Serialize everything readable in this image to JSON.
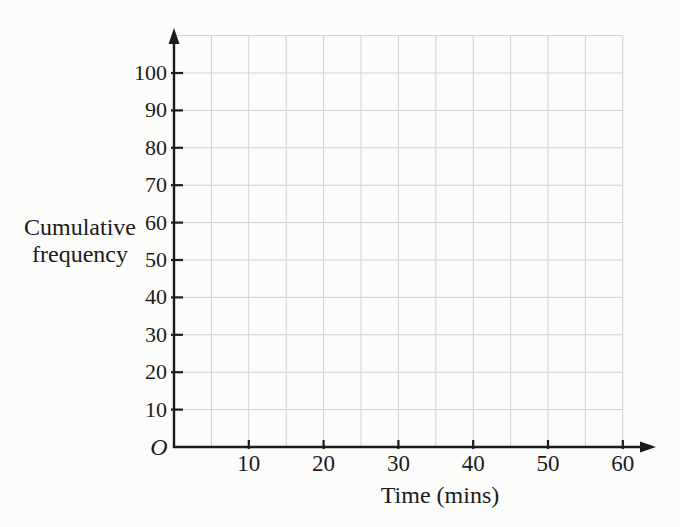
{
  "page": {
    "background": "#fcfcfb"
  },
  "colors": {
    "axis": "#1b1b1b",
    "grid": "#cfd0d4",
    "text": "#1b1b1b"
  },
  "chart_data": {
    "type": "line",
    "title": "",
    "xlabel": "Time (mins)",
    "ylabel": "Cumulative frequency",
    "ylabel_lines": [
      "Cumulative",
      "frequency"
    ],
    "origin_label": "O",
    "x_axis": {
      "min": 0,
      "max": 60,
      "ticks": [
        10,
        20,
        30,
        40,
        50,
        60
      ],
      "grid_step": 5,
      "arrow": true
    },
    "y_axis": {
      "min": 0,
      "max": 110,
      "ticks": [
        10,
        20,
        30,
        40,
        50,
        60,
        70,
        80,
        90,
        100
      ],
      "grid_step": 10,
      "arrow": true
    },
    "series": [],
    "legend": null,
    "grid": true
  }
}
